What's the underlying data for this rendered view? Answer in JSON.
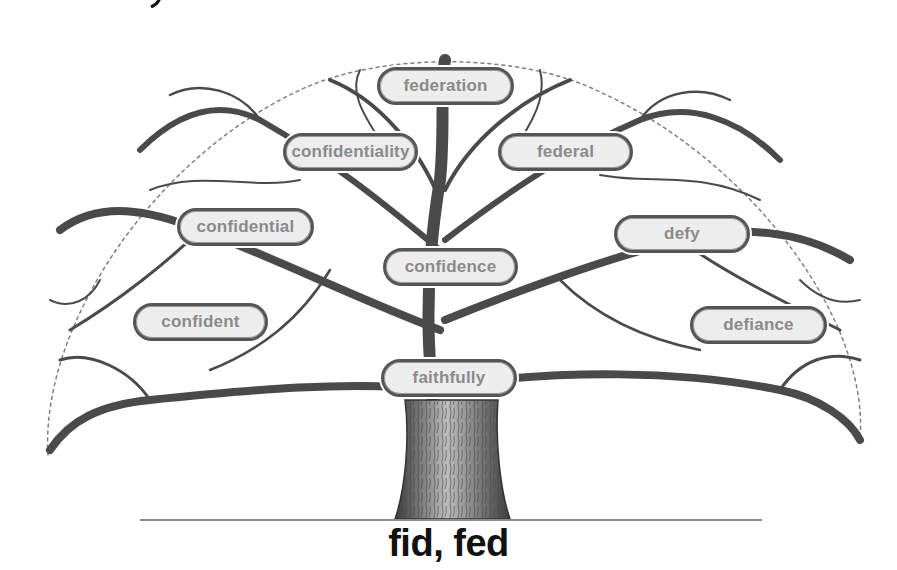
{
  "diagram": {
    "type": "word-family-tree",
    "root": "fid, fed",
    "words": [
      {
        "label": "federation",
        "x": 377,
        "y": 67,
        "w": 137
      },
      {
        "label": "confidentiality",
        "x": 283,
        "y": 133,
        "w": 135
      },
      {
        "label": "federal",
        "x": 498,
        "y": 133,
        "w": 135
      },
      {
        "label": "confidential",
        "x": 177,
        "y": 208,
        "w": 137
      },
      {
        "label": "defy",
        "x": 614,
        "y": 215,
        "w": 136
      },
      {
        "label": "confidence",
        "x": 383,
        "y": 248,
        "w": 135
      },
      {
        "label": "confident",
        "x": 133,
        "y": 303,
        "w": 135
      },
      {
        "label": "defiance",
        "x": 690,
        "y": 306,
        "w": 137
      },
      {
        "label": "faithfully",
        "x": 381,
        "y": 359,
        "w": 136
      }
    ],
    "colors": {
      "pill_fill": "#ededed",
      "pill_border": "#555555",
      "pill_text": "#8a8a8a",
      "branch": "#4a4a4a",
      "root_text": "#111111",
      "ground_line": "#8a8a8a"
    }
  }
}
